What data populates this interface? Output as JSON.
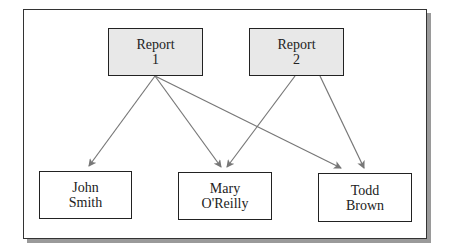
{
  "diagram": {
    "reports": [
      {
        "id": "r1",
        "line1": "Report",
        "line2": "1"
      },
      {
        "id": "r2",
        "line1": "Report",
        "line2": "2"
      }
    ],
    "people": [
      {
        "id": "p1",
        "line1": "John",
        "line2": "Smith"
      },
      {
        "id": "p2",
        "line1": "Mary",
        "line2": "O'Reilly"
      },
      {
        "id": "p3",
        "line1": "Todd",
        "line2": "Brown"
      }
    ],
    "edges": [
      {
        "from": "r1",
        "to": "p1"
      },
      {
        "from": "r1",
        "to": "p2"
      },
      {
        "from": "r1",
        "to": "p3"
      },
      {
        "from": "r2",
        "to": "p2"
      },
      {
        "from": "r2",
        "to": "p3"
      }
    ],
    "colors": {
      "report_fill": "#e8e8e8",
      "border": "#222222",
      "edge": "#777777",
      "shadow": "#9a9a9a"
    }
  }
}
